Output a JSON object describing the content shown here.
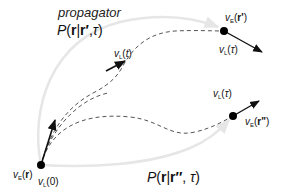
{
  "title": {
    "line1": "propagator",
    "line2_P": "P",
    "line2_open": "(",
    "line2_r": "r",
    "line2_bar": "|",
    "line2_rp": "r′",
    "line2_comma": ",",
    "line2_tau": "τ",
    "line2_close": ")"
  },
  "bottom_propagator": {
    "P": "P",
    "open": "(",
    "r": "r",
    "bar": "|",
    "rpp": "r′′",
    "comma": ", ",
    "tau": "τ",
    "close": ")"
  },
  "labels": {
    "vE_r": {
      "v": "v",
      "sub": "E",
      "arg_open": "(",
      "arg": "r",
      "arg_close": ")"
    },
    "vL_0": {
      "v": "v",
      "sub": "L",
      "arg": "(0)"
    },
    "vL_t": {
      "v": "v",
      "sub": "L",
      "arg_open": "(",
      "arg": "t",
      "arg_close": ")"
    },
    "vE_rp": {
      "v": "v",
      "sub": "E",
      "arg_open": "(",
      "arg": "r'",
      "arg_close": ")"
    },
    "vL_tau_top": {
      "v": "v",
      "sub": "L",
      "arg_open": "(",
      "arg": "τ",
      "arg_close": ")"
    },
    "vL_tau_bottom": {
      "v": "v",
      "sub": "L",
      "arg_open": "(",
      "arg": "τ",
      "arg_close": ")"
    },
    "vE_rpp": {
      "v": "v",
      "sub": "E",
      "arg_open": "(",
      "arg": "r\"",
      "arg_close": ")"
    }
  },
  "colors": {
    "propagator_arc": "#e6e6e6",
    "trajectory_dash": "#555555",
    "vector": "#111111",
    "point": "#000000"
  },
  "points": {
    "origin": [
      41,
      165
    ],
    "end_top": [
      224,
      31
    ],
    "end_bottom": [
      233,
      116
    ]
  }
}
